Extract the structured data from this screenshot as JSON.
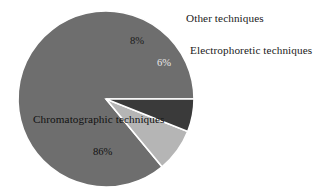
{
  "chart_data": {
    "type": "pie",
    "title": "",
    "subtitle": "",
    "xlabel": "",
    "ylabel": "",
    "legend_position": "none",
    "grid": false,
    "categories": [
      "Chromatographic techniques",
      "Other techniques",
      "Electrophoretic techniques"
    ],
    "values": [
      86,
      8,
      6
    ],
    "value_unit": "%",
    "slices": [
      {
        "label": "Chromatographic techniques",
        "value": 86,
        "value_label": "86%",
        "color": "#6e6e6e",
        "label_placement": "inside"
      },
      {
        "label": "Other techniques",
        "value": 8,
        "value_label": "8%",
        "color": "#b5b5b5",
        "label_placement": "outside"
      },
      {
        "label": "Electrophoretic techniques",
        "value": 6,
        "value_label": "6%",
        "color": "#3a3a3a",
        "label_placement": "outside"
      }
    ],
    "geometry": {
      "center_x": 106,
      "center_y": 99,
      "radius": 88,
      "start_angle_deg": 0,
      "direction": "counterclockwise"
    },
    "colors": {
      "background": "#ffffff",
      "separator": "#ffffff",
      "text": "#1a1a1a",
      "chromatographic": "#6e6e6e",
      "other": "#b5b5b5",
      "electrophoretic": "#3a3a3a"
    }
  }
}
